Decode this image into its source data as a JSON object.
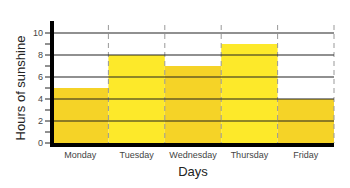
{
  "chart_data": {
    "type": "bar",
    "title": "",
    "xlabel": "Days",
    "ylabel": "Hours of sunshine",
    "categories": [
      "Monday",
      "Tuesday",
      "Wednesday",
      "Thursday",
      "Friday"
    ],
    "values": [
      5,
      8,
      7,
      9,
      4
    ],
    "ylim": [
      0,
      10
    ],
    "yticks": [
      0,
      2,
      4,
      6,
      8,
      10
    ],
    "grid": true,
    "legend": null,
    "colors": [
      "#f5d327",
      "#fde92a",
      "#f5d327",
      "#fde92a",
      "#f5d327"
    ]
  }
}
